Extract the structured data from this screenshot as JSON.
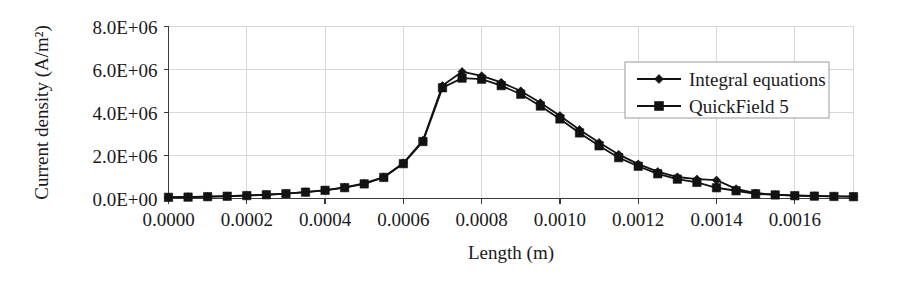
{
  "chart_data": {
    "type": "line",
    "title": "",
    "xlabel": "Length (m)",
    "ylabel": "Current density (A/m²)",
    "xlim": [
      0.0,
      0.00175
    ],
    "ylim": [
      0,
      8000000
    ],
    "xticks": [
      0.0,
      0.0002,
      0.0004,
      0.0006,
      0.0008,
      0.001,
      0.0012,
      0.0014,
      0.0016
    ],
    "xtick_labels": [
      "0.0000",
      "0.0002",
      "0.0004",
      "0.0006",
      "0.0008",
      "0.0010",
      "0.0012",
      "0.0014",
      "0.0016"
    ],
    "yticks": [
      0,
      2000000,
      4000000,
      6000000,
      8000000
    ],
    "ytick_labels": [
      "0.0E+00",
      "2.0E+06",
      "4.0E+06",
      "6.0E+06",
      "8.0E+06"
    ],
    "grid": true,
    "legend_position": "upper-right",
    "x": [
      0.0,
      5e-05,
      0.0001,
      0.00015,
      0.0002,
      0.00025,
      0.0003,
      0.00035,
      0.0004,
      0.00045,
      0.0005,
      0.00055,
      0.0006,
      0.00065,
      0.0007,
      0.00075,
      0.0008,
      0.00085,
      0.0009,
      0.00095,
      0.001,
      0.00105,
      0.0011,
      0.00115,
      0.0012,
      0.00125,
      0.0013,
      0.00135,
      0.0014,
      0.00145,
      0.0015,
      0.00155,
      0.0016,
      0.00165,
      0.0017,
      0.00175
    ],
    "series": [
      {
        "name": "Integral equations",
        "marker": "diamond",
        "color": "#121212",
        "values": [
          60000,
          70000,
          90000,
          110000,
          140000,
          180000,
          230000,
          300000,
          390000,
          520000,
          700000,
          1000000,
          1650000,
          2700000,
          5250000,
          5900000,
          5700000,
          5400000,
          5000000,
          4450000,
          3850000,
          3200000,
          2600000,
          2050000,
          1600000,
          1250000,
          1000000,
          900000,
          850000,
          450000,
          250000,
          180000,
          140000,
          120000,
          100000,
          90000
        ]
      },
      {
        "name": "QuickField 5",
        "marker": "square",
        "color": "#121212",
        "values": [
          55000,
          65000,
          85000,
          105000,
          135000,
          175000,
          225000,
          295000,
          380000,
          505000,
          680000,
          980000,
          1620000,
          2650000,
          5150000,
          5600000,
          5550000,
          5250000,
          4850000,
          4300000,
          3700000,
          3050000,
          2450000,
          1900000,
          1500000,
          1150000,
          900000,
          750000,
          500000,
          360000,
          220000,
          165000,
          130000,
          110000,
          95000,
          85000
        ]
      }
    ]
  },
  "legend": {
    "entries": [
      {
        "label": "Integral equations",
        "marker": "diamond"
      },
      {
        "label": "QuickField 5",
        "marker": "square"
      }
    ]
  }
}
